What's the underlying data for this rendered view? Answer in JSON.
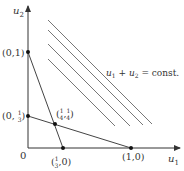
{
  "diagram": {
    "axes": {
      "x_label": "u",
      "x_sub": "1",
      "y_label": "u",
      "y_sub": "2",
      "origin_label": "0"
    },
    "points": [
      {
        "id": "p01",
        "label": "(0,1)"
      },
      {
        "id": "p0third",
        "label_pre": "(0, ",
        "num": "1",
        "den": "3",
        "label_post": ")"
      },
      {
        "id": "pthird0",
        "label_pre": "(",
        "num": "1",
        "den": "3",
        "label_post": ",0)"
      },
      {
        "id": "p10",
        "label": "(1,0)"
      },
      {
        "id": "pquarter",
        "label_pre": "(",
        "num1": "1",
        "den1": "4",
        "mid": ",",
        "num2": "1",
        "den2": "4",
        "label_post": ")"
      }
    ],
    "level_line_label": {
      "u1": "u",
      "sub1": "1",
      "plus": " + ",
      "u2": "u",
      "sub2": "2",
      "rest": " = const."
    },
    "colors": {
      "axis": "#333333",
      "constraint": "#444444",
      "level": "#666666",
      "point": "#111111"
    }
  }
}
